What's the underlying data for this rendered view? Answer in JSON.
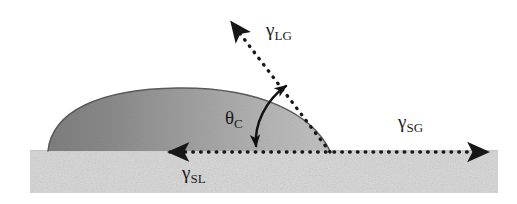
{
  "figure": {
    "background_color": "#ffffff",
    "width": 517,
    "height": 204
  },
  "labels": {
    "liquid_gas": {
      "symbol": "γ",
      "subscript": "LG",
      "name": "liquid-gas surface tension"
    },
    "solid_gas": {
      "symbol": "γ",
      "subscript": "SG",
      "name": "solid-gas surface tension"
    },
    "solid_liquid": {
      "symbol": "γ",
      "subscript": "SL",
      "name": "solid-liquid surface tension"
    },
    "contact_angle": {
      "symbol": "θ",
      "subscript": "C",
      "name": "contact angle"
    }
  },
  "colors": {
    "substrate": "#d9d9d9",
    "substrate_speckle": "#bcbcbc",
    "droplet_dark": "#8a8a8a",
    "droplet_light": "#bdbdbd",
    "droplet_outline": "#555555",
    "vector": "#171717",
    "arc": "#111111",
    "text": "#1a1a1a"
  },
  "geometry": {
    "substrate": {
      "x": 30,
      "y": 150,
      "width": 468,
      "height": 43
    },
    "droplet": {
      "left_contact_x": 48,
      "right_contact_x": 330,
      "baseline_y": 151,
      "apex_x": 178,
      "apex_y": 88
    },
    "contact_point": {
      "x": 330,
      "y": 152
    },
    "vector_lg": {
      "from_x": 330,
      "from_y": 152,
      "to_x": 230,
      "to_y": 20
    },
    "vector_sg": {
      "from_x": 333,
      "from_y": 152,
      "to_x": 492,
      "to_y": 152
    },
    "vector_sl": {
      "from_x": 327,
      "from_y": 152,
      "to_x": 154,
      "to_y": 152
    },
    "angle_arc": {
      "start_x": 284,
      "start_y": 84,
      "end_x": 256,
      "end_y": 149,
      "center_x": 330,
      "center_y": 152
    }
  }
}
